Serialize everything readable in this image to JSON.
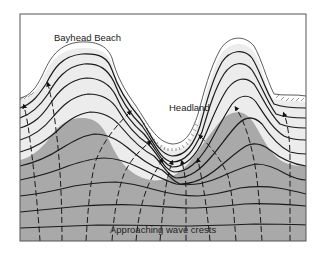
{
  "diagram": {
    "labels": {
      "bayhead_beach": "Bayhead Beach",
      "headland": "Headland",
      "approaching_wave_crests": "Approaching wave crests"
    },
    "elements": {
      "land": "land (white)",
      "shallow_water": "shallow water (light gray)",
      "deep_water": "deep water (dark gray)",
      "wave_crests": "solid curved lines",
      "orthogonals": "dashed lines with arrowheads"
    },
    "colors": {
      "land": "#ffffff",
      "shallow_water": "#ececec",
      "deep_water": "#a9a9a9",
      "lines": "#1a1a1a",
      "frame": "#555555"
    }
  }
}
